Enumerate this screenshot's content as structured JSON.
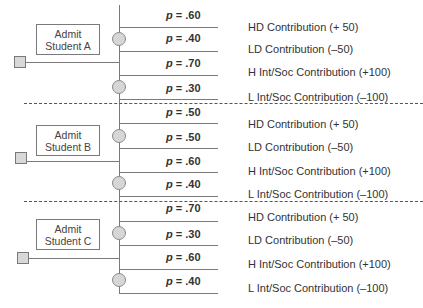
{
  "diagram": {
    "type": "decision-tree",
    "colors": {
      "line": "#7a7a7a",
      "node_fill": "#d6d6d6",
      "separator": "#555555",
      "text": "#333333"
    },
    "groups": [
      {
        "decision_label_line1": "Admit",
        "decision_label_line2": "Student A",
        "branches": [
          {
            "p_symbol": "p",
            "p_value": " = .60",
            "outcome": "HD Contribution  (+ 50)"
          },
          {
            "p_symbol": "p",
            "p_value": " = .40",
            "outcome": "LD Contribution  (–50)"
          },
          {
            "p_symbol": "p",
            "p_value": " = .70",
            "outcome": "H  Int/Soc Contribution  (+100)"
          },
          {
            "p_symbol": "p",
            "p_value": " = .30",
            "outcome": "L  Int/Soc Contribution  (–100)"
          }
        ]
      },
      {
        "decision_label_line1": "Admit",
        "decision_label_line2": "Student B",
        "branches": [
          {
            "p_symbol": "p",
            "p_value": " = .50",
            "outcome": "HD Contribution  (+ 50)"
          },
          {
            "p_symbol": "p",
            "p_value": " = .50",
            "outcome": "LD Contribution  (–50)"
          },
          {
            "p_symbol": "p",
            "p_value": " = .60",
            "outcome": "H  Int/Soc Contribution  (+100)"
          },
          {
            "p_symbol": "p",
            "p_value": " = .40",
            "outcome": "L  Int/Soc Contribution  (–100)"
          }
        ]
      },
      {
        "decision_label_line1": "Admit",
        "decision_label_line2": "Student C",
        "branches": [
          {
            "p_symbol": "p",
            "p_value": " = .70",
            "outcome": "HD Contribution  (+ 50)"
          },
          {
            "p_symbol": "p",
            "p_value": " = .30",
            "outcome": "LD Contribution  (–50)"
          },
          {
            "p_symbol": "p",
            "p_value": " = .60",
            "outcome": "H  Int/Soc Contribution  (+100)"
          },
          {
            "p_symbol": "p",
            "p_value": " = .40",
            "outcome": "L  Int/Soc Contribution  (–100)"
          }
        ]
      }
    ]
  }
}
